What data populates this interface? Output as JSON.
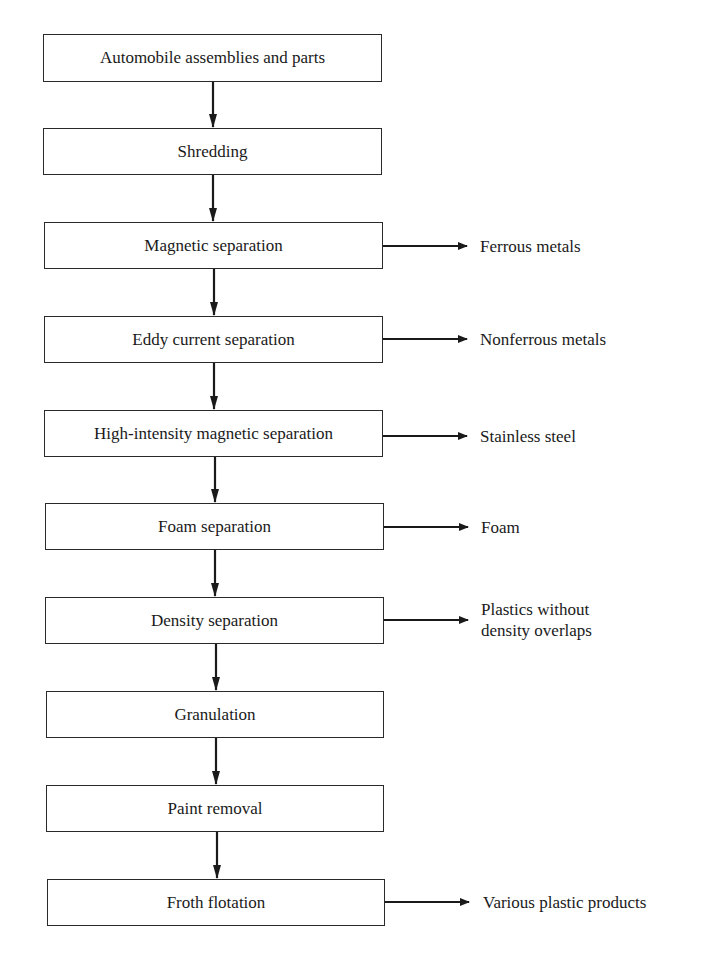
{
  "diagram": {
    "type": "process-flowchart",
    "colors": {
      "line": "#1a1a1a",
      "box_border": "#2a2a2a",
      "background": "#ffffff"
    },
    "steps": [
      {
        "label": "Automobile assemblies and parts",
        "output": null
      },
      {
        "label": "Shredding",
        "output": null
      },
      {
        "label": "Magnetic separation",
        "output": "Ferrous metals"
      },
      {
        "label": "Eddy current separation",
        "output": "Nonferrous metals"
      },
      {
        "label": "High-intensity magnetic separation",
        "output": "Stainless steel"
      },
      {
        "label": "Foam separation",
        "output": "Foam"
      },
      {
        "label": "Density separation",
        "output_lines": [
          "Plastics without",
          "density overlaps"
        ]
      },
      {
        "label": "Granulation",
        "output": null
      },
      {
        "label": "Paint removal",
        "output": null
      },
      {
        "label": "Froth flotation",
        "output": "Various plastic products"
      }
    ],
    "arrow_icon": "arrow-right-icon",
    "down_arrow_icon": "arrow-down-icon"
  }
}
